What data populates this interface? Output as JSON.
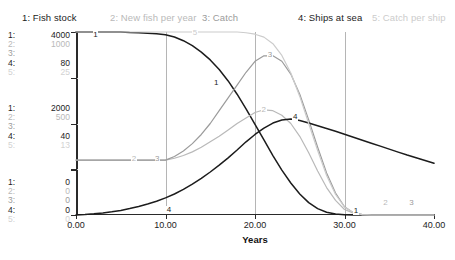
{
  "legend": {
    "items": [
      {
        "label": "1: Fish stock",
        "color": "#1c1c1c"
      },
      {
        "label": "2: New fish per year",
        "color": "#b9b9b9"
      },
      {
        "label": "3: Catch",
        "color": "#9b9b9b"
      },
      {
        "label": "4: Ships at sea",
        "color": "#1c1c1c"
      },
      {
        "label": "5: Catch per ship",
        "color": "#cccccc"
      }
    ]
  },
  "y_scales": {
    "top": {
      "s1": "4000",
      "s2": "1000",
      "s3": "",
      "s4": "80",
      "s5": "25"
    },
    "middle": {
      "s1": "2000",
      "s2": "500",
      "s3": "",
      "s4": "40",
      "s5": "13"
    },
    "bottom": {
      "s1": "0",
      "s2": "0",
      "s3": "0",
      "s4": "0",
      "s5": "0"
    }
  },
  "y_index_labels": {
    "i1": "1:",
    "i2": "2:",
    "i3": "3:",
    "i4": "4:",
    "i5": "5:"
  },
  "x_axis": {
    "title": "Years",
    "ticks": [
      "0.00",
      "10.00",
      "20.00",
      "30.00",
      "40.00"
    ]
  },
  "series_markers": [
    {
      "id": "1",
      "x": 2.1,
      "y": 3900
    },
    {
      "id": "1",
      "x": 15.6,
      "y": 2860
    },
    {
      "id": "2",
      "x": 6.4,
      "y": 300
    },
    {
      "id": "3",
      "x": 9.0,
      "y": 300
    },
    {
      "id": "4",
      "x": 10.3,
      "y": 1.5
    },
    {
      "id": "5",
      "x": 13.2,
      "y": 24.6
    },
    {
      "id": "2",
      "x": 20.9,
      "y": 565
    },
    {
      "id": "3",
      "x": 21.6,
      "y": 865
    },
    {
      "id": "4",
      "x": 24.4,
      "y": 42
    },
    {
      "id": "1",
      "x": 31.2,
      "y": 60
    },
    {
      "id": "2",
      "x": 34.5,
      "y": 60
    },
    {
      "id": "3",
      "x": 37.4,
      "y": 60
    }
  ],
  "chart_data": {
    "type": "line",
    "title": "",
    "xlabel": "Years",
    "ylabel": "",
    "xlim": [
      0,
      40
    ],
    "grid": true,
    "legend_position": "top",
    "x": [
      0,
      1,
      2,
      3,
      4,
      5,
      6,
      7,
      8,
      9,
      10,
      11,
      12,
      13,
      14,
      15,
      16,
      17,
      18,
      19,
      20,
      21,
      22,
      23,
      24,
      25,
      26,
      27,
      28,
      29,
      30,
      31,
      32,
      33,
      34,
      35,
      36,
      37,
      38,
      39,
      40
    ],
    "series": [
      {
        "name": "Fish stock",
        "id": "1",
        "color": "#1c1c1c",
        "axis_range": [
          0,
          4000
        ],
        "values": [
          4000,
          4000,
          4000,
          4000,
          4000,
          4000,
          3990,
          3985,
          3975,
          3960,
          3940,
          3890,
          3810,
          3700,
          3560,
          3390,
          3180,
          2930,
          2640,
          2320,
          1980,
          1640,
          1300,
          980,
          700,
          460,
          270,
          140,
          60,
          20,
          5,
          2,
          0,
          0,
          0,
          0,
          0,
          0,
          0,
          0,
          0
        ]
      },
      {
        "name": "New fish per year",
        "id": "2",
        "color": "#b9b9b9",
        "axis_range": [
          0,
          1000
        ],
        "values": [
          300,
          300,
          300,
          300,
          300,
          300,
          300,
          300,
          300,
          300,
          300,
          310,
          325,
          345,
          370,
          400,
          430,
          465,
          500,
          530,
          560,
          575,
          570,
          545,
          500,
          430,
          340,
          240,
          150,
          80,
          30,
          10,
          2,
          0,
          0,
          0,
          0,
          0,
          0,
          0,
          0
        ]
      },
      {
        "name": "Catch",
        "id": "3",
        "color": "#9b9b9b",
        "axis_range": [
          0,
          1000
        ],
        "values": [
          300,
          300,
          300,
          300,
          300,
          300,
          300,
          300,
          300,
          300,
          300,
          320,
          350,
          390,
          440,
          500,
          570,
          640,
          710,
          780,
          840,
          870,
          870,
          840,
          770,
          660,
          520,
          370,
          230,
          120,
          45,
          12,
          2,
          0,
          0,
          0,
          0,
          0,
          0,
          0,
          0
        ]
      },
      {
        "name": "Ships at sea",
        "id": "4",
        "color": "#1c1c1c",
        "axis_range": [
          0,
          80
        ],
        "values": [
          0,
          0.2,
          0.5,
          0.9,
          1.4,
          2.0,
          2.8,
          3.7,
          4.8,
          6.0,
          7.5,
          9.2,
          11.2,
          13.5,
          16.0,
          18.8,
          21.8,
          25.0,
          28.4,
          32.0,
          35.2,
          38.0,
          40.2,
          41.5,
          42.0,
          41.3,
          40.2,
          39.0,
          37.8,
          36.6,
          35.3,
          34.0,
          32.7,
          31.4,
          30.1,
          28.8,
          27.5,
          26.2,
          25.0,
          23.8,
          22.6
        ]
      },
      {
        "name": "Catch per ship",
        "id": "5",
        "color": "#cccccc",
        "axis_range": [
          0,
          25
        ],
        "values": [
          25,
          25,
          25,
          25,
          25,
          25,
          25,
          25,
          25,
          25,
          25,
          25,
          25,
          25,
          25,
          25,
          25,
          25,
          25,
          24.9,
          24.7,
          24.3,
          23.4,
          21.8,
          19.4,
          16.2,
          12.5,
          8.8,
          5.4,
          2.8,
          1.1,
          0.3,
          0.05,
          0,
          0,
          0,
          0,
          0,
          0,
          0,
          0
        ]
      }
    ]
  }
}
